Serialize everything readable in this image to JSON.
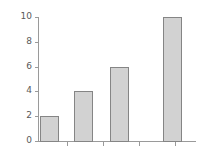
{
  "chart_data": {
    "type": "bar",
    "title": "",
    "subtitle": "",
    "xlabel": "",
    "ylabel": "",
    "categories": [
      "",
      "",
      "",
      ""
    ],
    "values": [
      2,
      4,
      6,
      10
    ],
    "ylim": [
      0,
      10
    ],
    "y_ticks": [
      0,
      2,
      4,
      6,
      8,
      10
    ],
    "y_tick_labels": [
      "0",
      "2",
      "4",
      "6",
      "8",
      "10"
    ],
    "x_ticks_count": 4,
    "x_tick_labels": [
      "",
      "",
      "",
      ""
    ],
    "grid": false,
    "legend": null,
    "legend_position": "none",
    "bar_fill_color": "#d2d2d2",
    "bar_edge_color": "#858585",
    "axis_color": "#9a9a9a",
    "tick_label_color": "#5a5a5a",
    "background_color": "#ffffff",
    "annotations": []
  },
  "geometry": {
    "plot_left_px": 38,
    "plot_baseline_px": 141,
    "plot_top_px": 17,
    "bar_width_px": 19,
    "bar_left_px": [
      40,
      74,
      110,
      163
    ],
    "x_tick_px": [
      67,
      103,
      139,
      175
    ]
  }
}
